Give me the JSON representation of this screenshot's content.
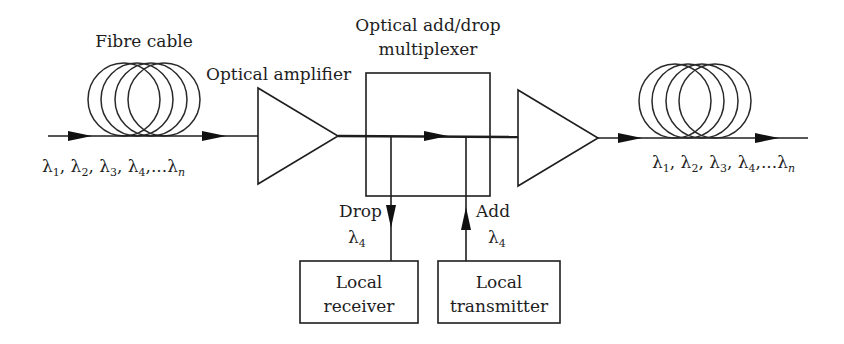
{
  "diagram": {
    "labels": {
      "fibre_cable": "Fibre cable",
      "optical_amplifier": "Optical amplifier",
      "oadm_line1": "Optical add/drop",
      "oadm_line2": "multiplexer",
      "drop": "Drop",
      "add": "Add",
      "drop_lambda": "λ",
      "drop_lambda_sub": "4",
      "add_lambda": "λ",
      "add_lambda_sub": "4",
      "receiver_line1": "Local",
      "receiver_line2": "receiver",
      "transmitter_line1": "Local",
      "transmitter_line2": "transmitter"
    },
    "input_wavelengths": {
      "parts": [
        {
          "sym": "λ",
          "sub": "1",
          "sep": ", "
        },
        {
          "sym": "λ",
          "sub": "2",
          "sep": ", "
        },
        {
          "sym": "λ",
          "sub": "3",
          "sep": ", "
        },
        {
          "sym": "λ",
          "sub": "4",
          "sep": ",..."
        },
        {
          "sym": "λ",
          "sub": "n",
          "sep": ""
        }
      ]
    },
    "output_wavelengths": {
      "parts": [
        {
          "sym": "λ",
          "sub": "1",
          "sep": ", "
        },
        {
          "sym": "λ",
          "sub": "2",
          "sep": ", "
        },
        {
          "sym": "λ",
          "sub": "3",
          "sep": ", "
        },
        {
          "sym": "λ",
          "sub": "4",
          "sep": ",..."
        },
        {
          "sym": "λ",
          "sub": "n",
          "sep": ""
        }
      ]
    },
    "components": [
      "Fibre cable (input)",
      "Optical amplifier",
      "Optical add/drop multiplexer",
      "Optical amplifier",
      "Fibre cable (output)",
      "Local receiver",
      "Local transmitter"
    ],
    "colors": {
      "stroke": "#1e1e1e",
      "background": "#ffffff"
    }
  }
}
